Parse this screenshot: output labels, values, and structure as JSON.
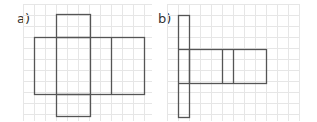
{
  "figures": [
    {
      "label": "a)",
      "description": "net of a rectangular prism with squares above and below",
      "grid": {
        "x0": 23,
        "y0": 4,
        "x1": 152,
        "y1": 121,
        "step": 11
      },
      "shapes": [
        {
          "name": "top-square",
          "x": 56,
          "y": 14,
          "w": 34,
          "h": 23
        },
        {
          "name": "main-rectangle",
          "x": 34,
          "y": 37,
          "w": 110,
          "h": 57
        },
        {
          "name": "bottom-square",
          "x": 56,
          "y": 94,
          "w": 34,
          "h": 22
        }
      ],
      "lines": [
        {
          "name": "divider-left",
          "x1": 56,
          "y1": 37,
          "x2": 56,
          "y2": 94
        },
        {
          "name": "divider-mid",
          "x1": 90,
          "y1": 37,
          "x2": 90,
          "y2": 94
        },
        {
          "name": "divider-right",
          "x1": 111,
          "y1": 37,
          "x2": 111,
          "y2": 94
        }
      ]
    },
    {
      "label": "b)",
      "description": "net with tall vertical strip and horizontal rectangle",
      "grid": {
        "x0": 167,
        "y0": 4,
        "x1": 300,
        "y1": 121,
        "step": 11
      },
      "shapes": [
        {
          "name": "tall-strip",
          "x": 178,
          "y": 15,
          "w": 11,
          "h": 102
        },
        {
          "name": "horizontal-rectangle",
          "x": 189,
          "y": 49,
          "w": 77,
          "h": 34
        }
      ],
      "lines": [
        {
          "name": "strip-divider-top",
          "x1": 178,
          "y1": 49,
          "x2": 189,
          "y2": 49
        },
        {
          "name": "strip-divider-bottom",
          "x1": 178,
          "y1": 83,
          "x2": 189,
          "y2": 83
        },
        {
          "name": "divider-1",
          "x1": 222,
          "y1": 49,
          "x2": 222,
          "y2": 83
        },
        {
          "name": "divider-2",
          "x1": 233,
          "y1": 49,
          "x2": 233,
          "y2": 83
        }
      ]
    }
  ],
  "colors": {
    "stroke": "#555555",
    "grid": "#e6e6e6",
    "label": "#333333"
  }
}
